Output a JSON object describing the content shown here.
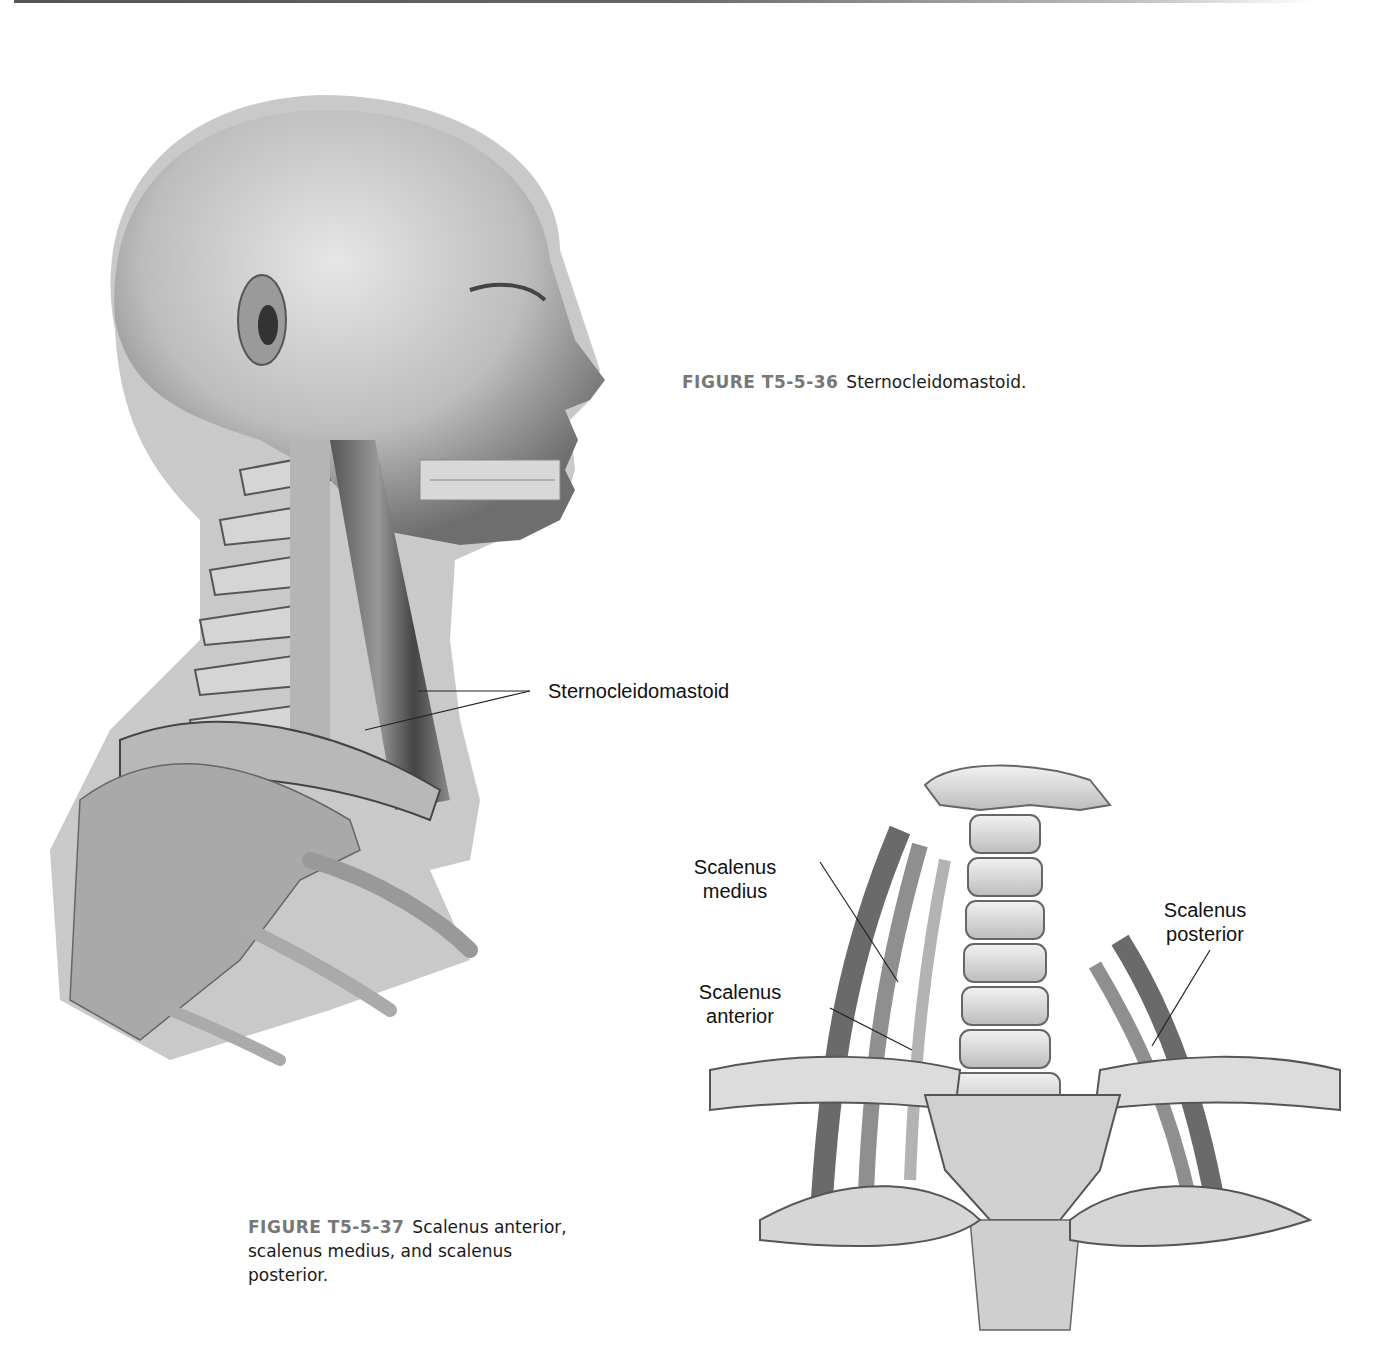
{
  "page": {
    "figures": [
      {
        "id": "T5-5-36",
        "number_label": "FIGURE T5-5-36",
        "caption_text": "Sternocleidomastoid.",
        "illustration": "lateral-head-neck-skeleton-with-sternocleidomastoid",
        "labels": [
          {
            "text": "Sternocleidomastoid"
          }
        ]
      },
      {
        "id": "T5-5-37",
        "number_label": "FIGURE T5-5-37",
        "caption_line1": "Scalenus anterior,",
        "caption_line2": "scalenus medius, and scalenus",
        "caption_line3": "posterior.",
        "illustration": "anterior-cervical-spine-with-scalene-muscles",
        "labels": [
          {
            "line1": "Scalenus",
            "line2": "medius"
          },
          {
            "line1": "Scalenus",
            "line2": "anterior"
          },
          {
            "line1": "Scalenus",
            "line2": "posterior"
          }
        ]
      }
    ]
  }
}
